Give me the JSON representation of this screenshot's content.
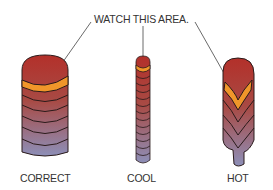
{
  "diagram": {
    "callout": "WATCH THIS AREA.",
    "beads": [
      {
        "id": "correct",
        "label": "CORRECT"
      },
      {
        "id": "cool",
        "label": "COOL"
      },
      {
        "id": "hot",
        "label": "HOT"
      }
    ]
  },
  "colors": {
    "hot_top": "#b3302a",
    "ring": "#f0962a",
    "bottom": "#8d8fb8",
    "outline": "#2a1a1a"
  }
}
